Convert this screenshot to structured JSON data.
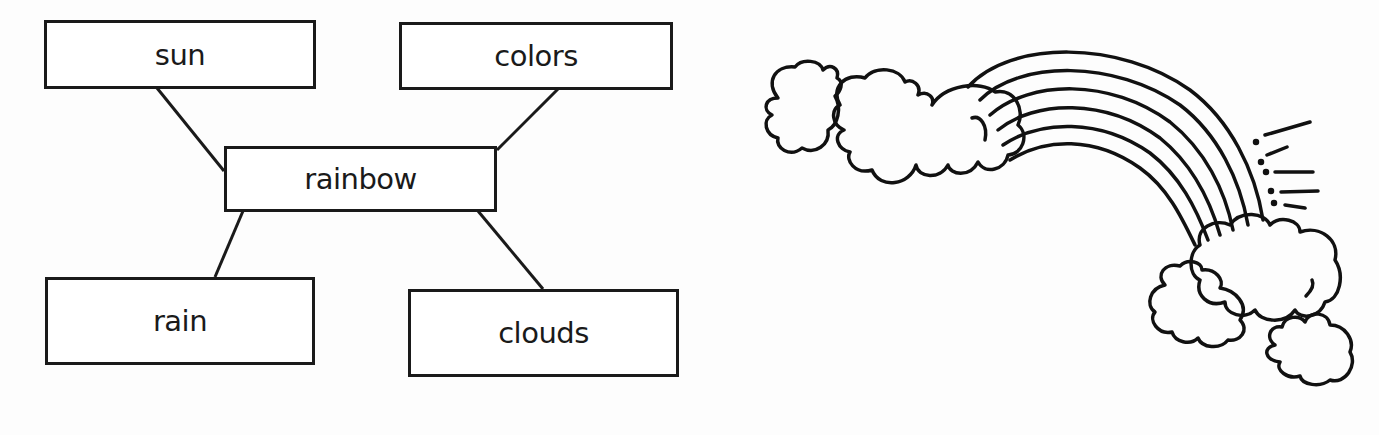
{
  "web_diagram": {
    "center": {
      "label": "rainbow"
    },
    "nodes": [
      {
        "id": "sun",
        "label": "sun",
        "position": "top-left"
      },
      {
        "id": "colors",
        "label": "colors",
        "position": "top-right"
      },
      {
        "id": "rain",
        "label": "rain",
        "position": "bottom-left"
      },
      {
        "id": "clouds",
        "label": "clouds",
        "position": "bottom-right"
      }
    ],
    "connections": [
      {
        "from": "rainbow",
        "to": "sun"
      },
      {
        "from": "rainbow",
        "to": "colors"
      },
      {
        "from": "rainbow",
        "to": "rain"
      },
      {
        "from": "rainbow",
        "to": "clouds"
      }
    ]
  },
  "illustration": {
    "subject": "rainbow arching between clouds with sun rays",
    "arc_count": 6,
    "cloud_count": 5
  },
  "colors": {
    "ink": "#1a1a1a",
    "paper": "#ffffff"
  }
}
